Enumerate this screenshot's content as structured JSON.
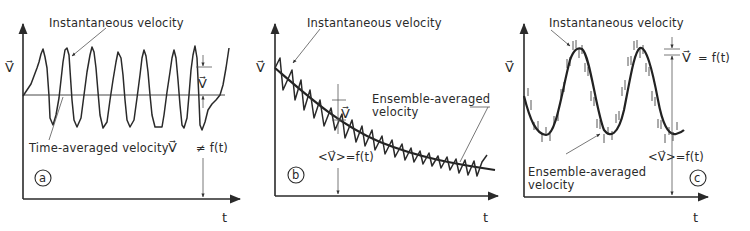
{
  "figure": {
    "panels": [
      {
        "id": "a",
        "badge": "a",
        "y_axis_label": "V⃗",
        "x_axis_label": "t",
        "labels": {
          "instantaneous": "Instantaneous velocity",
          "time_averaged": "Time-averaged velocity",
          "mean_symbol": "V⃗",
          "relation": "≠  f(t)",
          "fluctuation": "V⃗"
        },
        "description": "Stationary turbulent signal fluctuating about a constant time-averaged velocity"
      },
      {
        "id": "b",
        "badge": "b",
        "y_axis_label": "V⃗",
        "x_axis_label": "t",
        "labels": {
          "instantaneous": "Instantaneous velocity",
          "ensemble_line1": "Ensemble-averaged",
          "ensemble_line2": "velocity",
          "fluctuation": "V⃗",
          "relation": "<V⃗>=f(t)"
        },
        "description": "Non-stationary decaying signal with fluctuations about a decreasing ensemble average"
      },
      {
        "id": "c",
        "badge": "c",
        "y_axis_label": "V⃗",
        "x_axis_label": "t",
        "labels": {
          "instantaneous": "Instantaneous velocity",
          "ensemble_line1": "Ensemble-averaged",
          "ensemble_line2": "velocity",
          "fluctuation": "V⃗",
          "fluct_relation": "=  f(t)",
          "relation": "<V⃗>=f(t)"
        },
        "description": "Periodic signal with small fluctuations about a sinusoidal ensemble average"
      }
    ]
  }
}
